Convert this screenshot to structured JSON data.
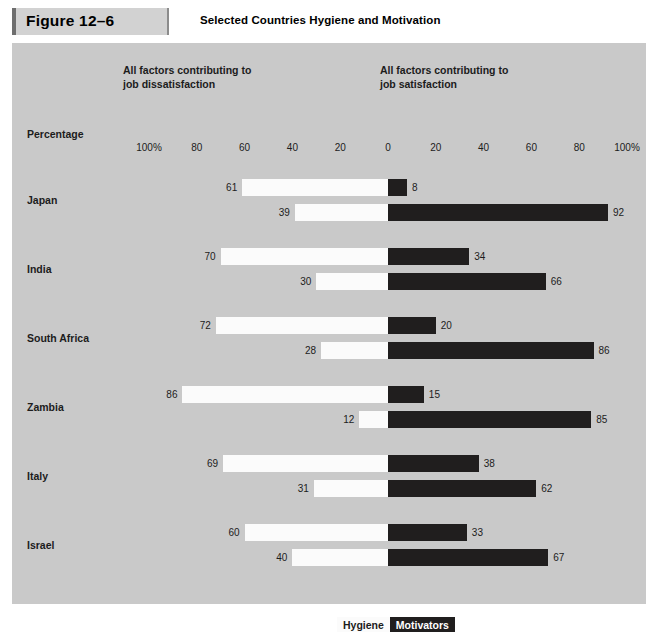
{
  "header": {
    "figure_number": "Figure 12–6",
    "title": "Selected Countries Hygiene and Motivation"
  },
  "chart_body": {
    "column_headers": {
      "left": "All factors contributing to\njob dissatisfaction",
      "right": "All factors contributing to\njob satisfaction"
    },
    "axis_title": "Percentage",
    "axis_ticks": [
      "100%",
      "80",
      "60",
      "40",
      "20",
      "0",
      "20",
      "40",
      "60",
      "80",
      "100%"
    ],
    "legend": {
      "hygiene_label": "Hygiene",
      "motivators_label": "Motivators"
    }
  },
  "colors": {
    "page_background": "#ffffff",
    "chart_background": "#c9c9c9",
    "figure_box": "#d2d2d2",
    "figure_rule": "#6e6e6e",
    "hygiene_bar": "#fbfbfb",
    "motivator_bar": "#201e1e",
    "text": "#1c1c1c"
  },
  "chart_data": {
    "type": "bar",
    "title": "Selected Countries Hygiene and Motivation",
    "subtitle": "",
    "xlabel": "Percentage",
    "ylabel": "",
    "xlim": [
      -100,
      100
    ],
    "grid": false,
    "legend_position": "bottom-center",
    "orientation": "horizontal-diverging",
    "axis_ticks": [
      "100%",
      "80",
      "60",
      "40",
      "20",
      "0",
      "20",
      "40",
      "60",
      "80",
      "100%"
    ],
    "tick_values": [
      -100,
      -80,
      -60,
      -40,
      -20,
      0,
      20,
      40,
      60,
      80,
      100
    ],
    "series": [
      {
        "name": "Hygiene",
        "side": "left",
        "color": "#fbfbfb"
      },
      {
        "name": "Motivators",
        "side": "right",
        "color": "#201e1e"
      }
    ],
    "categories": [
      "Japan",
      "India",
      "South Africa",
      "Zambia",
      "Italy",
      "Israel"
    ],
    "rows": [
      {
        "country": "Japan",
        "bars": [
          {
            "left_value": 61,
            "right_value": 8,
            "left_label": "61",
            "right_label": "8"
          },
          {
            "left_value": 39,
            "right_value": 92,
            "left_label": "39",
            "right_label": "92"
          }
        ]
      },
      {
        "country": "India",
        "bars": [
          {
            "left_value": 70,
            "right_value": 34,
            "left_label": "70",
            "right_label": "34"
          },
          {
            "left_value": 30,
            "right_value": 66,
            "left_label": "30",
            "right_label": "66"
          }
        ]
      },
      {
        "country": "South Africa",
        "bars": [
          {
            "left_value": 72,
            "right_value": 20,
            "left_label": "72",
            "right_label": "20"
          },
          {
            "left_value": 28,
            "right_value": 86,
            "left_label": "28",
            "right_label": "86"
          }
        ]
      },
      {
        "country": "Zambia",
        "bars": [
          {
            "left_value": 86,
            "right_value": 15,
            "left_label": "86",
            "right_label": "15"
          },
          {
            "left_value": 12,
            "right_value": 85,
            "left_label": "12",
            "right_label": "85"
          }
        ]
      },
      {
        "country": "Italy",
        "bars": [
          {
            "left_value": 69,
            "right_value": 38,
            "left_label": "69",
            "right_label": "38"
          },
          {
            "left_value": 31,
            "right_value": 62,
            "left_label": "31",
            "right_label": "62"
          }
        ]
      },
      {
        "country": "Israel",
        "bars": [
          {
            "left_value": 60,
            "right_value": 33,
            "left_label": "60",
            "right_label": "33"
          },
          {
            "left_value": 40,
            "right_value": 67,
            "left_label": "40",
            "right_label": "67"
          }
        ]
      }
    ]
  }
}
